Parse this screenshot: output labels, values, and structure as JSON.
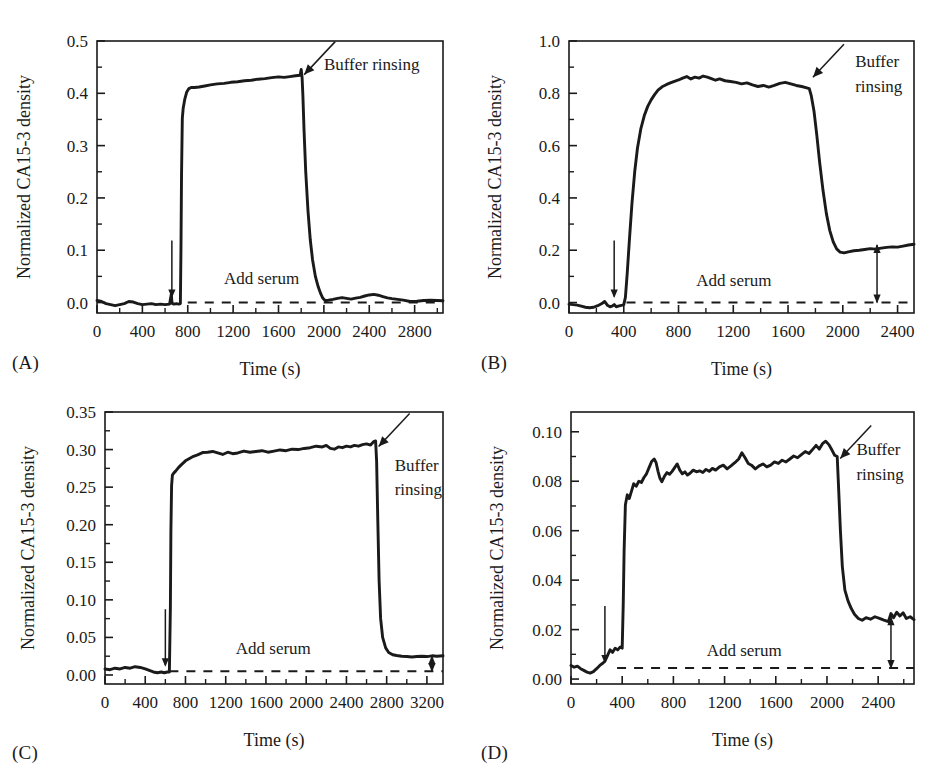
{
  "figure": {
    "panel_count": 4,
    "shared_ylabel": "Normalized CA15-3 density",
    "shared_xlabel": "Time (s)",
    "annotation_add_serum": "Add serum",
    "annotation_buffer_rinsing": "Buffer rinsing",
    "annotation_buffer": "Buffer",
    "annotation_rinsing": "rinsing",
    "line_color": "#1a1a1a",
    "axis_color": "#1a1a1a",
    "background": "#ffffff"
  },
  "chart_data": [
    {
      "type": "line",
      "panel": "(A)",
      "title": "",
      "xlabel": "Time (s)",
      "ylabel": "Normalized CA15-3 density",
      "xlim": [
        0,
        3050
      ],
      "ylim": [
        -0.02,
        0.5
      ],
      "xticks": [
        0,
        400,
        800,
        1200,
        1600,
        2000,
        2400,
        2800
      ],
      "yticks": [
        0.0,
        0.1,
        0.2,
        0.3,
        0.4,
        0.5
      ],
      "ytick_labels": [
        "0.0",
        "0.1",
        "0.2",
        "0.3",
        "0.4",
        "0.5"
      ],
      "xtick_labels": [
        "0",
        "400",
        "800",
        "1200",
        "1600",
        "2000",
        "2400",
        "2800"
      ],
      "minor_ticks": true,
      "grid": false,
      "legend": false,
      "baseline_dashed_y": 0.0,
      "baseline_dashed_x_start": 800,
      "baseline_dashed_x_end": 3050,
      "add_serum_time": 660,
      "buffer_rinsing_time": 1800,
      "plateau_value": 0.43,
      "final_value": 0.005,
      "annotations": [
        {
          "text": "Buffer rinsing",
          "x": 2000,
          "y": 0.445
        },
        {
          "text": "Add serum",
          "x": 1120,
          "y": 0.035
        }
      ],
      "x": [
        0,
        40,
        80,
        120,
        160,
        200,
        240,
        280,
        320,
        360,
        400,
        440,
        480,
        520,
        560,
        600,
        640,
        655,
        660,
        665,
        680,
        700,
        720,
        735,
        740,
        745,
        752,
        760,
        775,
        790,
        810,
        830,
        860,
        900,
        950,
        1000,
        1060,
        1120,
        1180,
        1240,
        1300,
        1360,
        1420,
        1480,
        1540,
        1600,
        1650,
        1700,
        1750,
        1790,
        1800,
        1808,
        1815,
        1825,
        1840,
        1860,
        1880,
        1900,
        1925,
        1950,
        1970,
        1990,
        2010,
        2040,
        2080,
        2120,
        2160,
        2200,
        2240,
        2280,
        2320,
        2360,
        2400,
        2440,
        2480,
        2520,
        2560,
        2600,
        2650,
        2700,
        2760,
        2820,
        2880,
        2940,
        3000,
        3050
      ],
      "y": [
        0.004,
        0.002,
        -0.002,
        -0.004,
        -0.006,
        -0.004,
        -0.002,
        0.002,
        0.001,
        -0.002,
        -0.004,
        -0.003,
        -0.002,
        -0.004,
        -0.003,
        -0.004,
        -0.003,
        0.016,
        0.002,
        -0.002,
        -0.003,
        -0.002,
        -0.003,
        -0.002,
        0.1,
        0.24,
        0.352,
        0.372,
        0.39,
        0.402,
        0.409,
        0.411,
        0.411,
        0.412,
        0.414,
        0.416,
        0.418,
        0.419,
        0.421,
        0.422,
        0.424,
        0.425,
        0.427,
        0.428,
        0.43,
        0.4315,
        0.4305,
        0.432,
        0.4335,
        0.4345,
        0.4455,
        0.43,
        0.395,
        0.33,
        0.25,
        0.175,
        0.12,
        0.082,
        0.05,
        0.03,
        0.018,
        0.0085,
        0.004,
        0.0045,
        0.006,
        0.008,
        0.0095,
        0.008,
        0.0065,
        0.0085,
        0.01,
        0.0125,
        0.0145,
        0.0155,
        0.014,
        0.0115,
        0.009,
        0.0075,
        0.006,
        0.0045,
        0.002,
        0.0025,
        0.004,
        0.0045,
        0.004,
        0.0035
      ]
    },
    {
      "type": "line",
      "panel": "(B)",
      "title": "",
      "xlabel": "Time (s)",
      "ylabel": "Normalized CA15-3 density",
      "xlim": [
        0,
        2520
      ],
      "ylim": [
        -0.04,
        1.0
      ],
      "xticks": [
        0,
        400,
        800,
        1200,
        1600,
        2000,
        2400
      ],
      "yticks": [
        0.0,
        0.2,
        0.4,
        0.6,
        0.8,
        1.0
      ],
      "ytick_labels": [
        "0.0",
        "0.2",
        "0.4",
        "0.6",
        "0.8",
        "1.0"
      ],
      "xtick_labels": [
        "0",
        "400",
        "800",
        "1200",
        "1600",
        "2000",
        "2400"
      ],
      "minor_ticks": true,
      "grid": false,
      "legend": false,
      "baseline_dashed_y": 0.0,
      "baseline_dashed_x_start": 420,
      "baseline_dashed_x_end": 2520,
      "add_serum_time": 330,
      "buffer_rinsing_time": 1760,
      "plateau_value": 0.85,
      "final_value": 0.22,
      "measure_arrow_x": 2250,
      "annotations": [
        {
          "text": "Buffer",
          "x": 2090,
          "y": 0.9
        },
        {
          "text": "rinsing",
          "x": 2090,
          "y": 0.805
        },
        {
          "text": "Add serum",
          "x": 930,
          "y": 0.065
        }
      ],
      "x": [
        0,
        30,
        60,
        90,
        120,
        150,
        180,
        210,
        240,
        260,
        280,
        300,
        315,
        330,
        345,
        360,
        375,
        390,
        400,
        412,
        425,
        440,
        460,
        480,
        500,
        525,
        550,
        575,
        600,
        625,
        650,
        680,
        710,
        740,
        770,
        800,
        830,
        860,
        890,
        920,
        950,
        980,
        1010,
        1040,
        1070,
        1100,
        1140,
        1180,
        1220,
        1260,
        1300,
        1340,
        1380,
        1420,
        1460,
        1500,
        1540,
        1580,
        1620,
        1660,
        1700,
        1730,
        1755,
        1770,
        1790,
        1810,
        1830,
        1855,
        1880,
        1905,
        1930,
        1955,
        1980,
        2010,
        2040,
        2080,
        2120,
        2160,
        2200,
        2240,
        2280,
        2320,
        2360,
        2400,
        2440,
        2480,
        2520
      ],
      "y": [
        -0.006,
        -0.008,
        -0.01,
        -0.014,
        -0.018,
        -0.02,
        -0.018,
        -0.012,
        -0.004,
        0.004,
        -0.01,
        -0.016,
        -0.014,
        -0.008,
        -0.016,
        -0.014,
        -0.012,
        -0.01,
        -0.008,
        0.02,
        0.11,
        0.23,
        0.38,
        0.5,
        0.59,
        0.665,
        0.715,
        0.75,
        0.775,
        0.795,
        0.812,
        0.825,
        0.833,
        0.84,
        0.846,
        0.851,
        0.858,
        0.864,
        0.855,
        0.862,
        0.858,
        0.866,
        0.862,
        0.856,
        0.85,
        0.855,
        0.848,
        0.845,
        0.842,
        0.836,
        0.84,
        0.832,
        0.826,
        0.83,
        0.824,
        0.83,
        0.838,
        0.842,
        0.836,
        0.83,
        0.826,
        0.822,
        0.818,
        0.79,
        0.73,
        0.64,
        0.54,
        0.43,
        0.34,
        0.275,
        0.232,
        0.205,
        0.193,
        0.19,
        0.194,
        0.198,
        0.2,
        0.203,
        0.206,
        0.204,
        0.208,
        0.211,
        0.213,
        0.212,
        0.216,
        0.22,
        0.223
      ]
    },
    {
      "type": "line",
      "panel": "(C)",
      "title": "",
      "xlabel": "Time (s)",
      "ylabel": "Normalized CA15-3 density",
      "xlim": [
        0,
        3360
      ],
      "ylim": [
        -0.012,
        0.35
      ],
      "xticks": [
        0,
        400,
        800,
        1200,
        1600,
        2000,
        2400,
        2800,
        3200
      ],
      "yticks": [
        0.0,
        0.05,
        0.1,
        0.15,
        0.2,
        0.25,
        0.3,
        0.35
      ],
      "ytick_labels": [
        "0.00",
        "0.05",
        "0.10",
        "0.15",
        "0.20",
        "0.25",
        "0.30",
        "0.35"
      ],
      "xtick_labels": [
        "0",
        "400",
        "800",
        "1200",
        "1600",
        "2000",
        "2400",
        "2800",
        "3200"
      ],
      "minor_ticks": true,
      "grid": false,
      "legend": false,
      "baseline_dashed_y": 0.005,
      "baseline_dashed_x_start": 640,
      "baseline_dashed_x_end": 3360,
      "add_serum_time": 600,
      "buffer_rinsing_time": 2690,
      "plateau_value": 0.3,
      "final_value": 0.025,
      "measure_arrow_x": 3250,
      "annotations": [
        {
          "text": "Buffer",
          "x": 2880,
          "y": 0.272
        },
        {
          "text": "rinsing",
          "x": 2880,
          "y": 0.24
        },
        {
          "text": "Add serum",
          "x": 1300,
          "y": 0.028
        }
      ],
      "x": [
        0,
        50,
        100,
        150,
        200,
        250,
        300,
        350,
        400,
        440,
        480,
        520,
        560,
        590,
        620,
        640,
        650,
        655,
        662,
        670,
        685,
        700,
        730,
        760,
        800,
        840,
        880,
        920,
        970,
        1020,
        1070,
        1120,
        1170,
        1220,
        1270,
        1320,
        1380,
        1440,
        1500,
        1560,
        1620,
        1680,
        1740,
        1800,
        1860,
        1920,
        1980,
        2040,
        2100,
        2160,
        2200,
        2240,
        2280,
        2320,
        2360,
        2400,
        2440,
        2480,
        2520,
        2560,
        2600,
        2640,
        2670,
        2690,
        2700,
        2712,
        2725,
        2740,
        2760,
        2790,
        2820,
        2860,
        2900,
        2950,
        3000,
        3050,
        3100,
        3150,
        3200,
        3250,
        3300,
        3360
      ],
      "y": [
        0.008,
        0.007,
        0.009,
        0.008,
        0.01,
        0.009,
        0.011,
        0.01,
        0.008,
        0.006,
        0.004,
        0.003,
        0.004,
        0.003,
        0.004,
        0.004,
        0.09,
        0.19,
        0.252,
        0.266,
        0.269,
        0.271,
        0.276,
        0.28,
        0.285,
        0.288,
        0.291,
        0.293,
        0.296,
        0.2965,
        0.2975,
        0.2955,
        0.2935,
        0.2965,
        0.2945,
        0.2955,
        0.298,
        0.2965,
        0.2975,
        0.2985,
        0.2965,
        0.298,
        0.2995,
        0.2985,
        0.3005,
        0.3,
        0.3015,
        0.3025,
        0.3045,
        0.3035,
        0.3055,
        0.3015,
        0.3005,
        0.3035,
        0.3025,
        0.3045,
        0.3035,
        0.3055,
        0.3045,
        0.3065,
        0.3075,
        0.306,
        0.3105,
        0.3115,
        0.285,
        0.205,
        0.125,
        0.075,
        0.05,
        0.036,
        0.03,
        0.027,
        0.026,
        0.025,
        0.0245,
        0.024,
        0.0245,
        0.025,
        0.0245,
        0.0255,
        0.025,
        0.0255
      ]
    },
    {
      "type": "line",
      "panel": "(D)",
      "title": "",
      "xlabel": "Time (s)",
      "ylabel": "Normalized CA15-3 density",
      "xlim": [
        0,
        2680
      ],
      "ylim": [
        -0.002,
        0.108
      ],
      "xticks": [
        0,
        400,
        800,
        1200,
        1600,
        2000,
        2400,
        2800
      ],
      "yticks": [
        0.0,
        0.02,
        0.04,
        0.06,
        0.08,
        0.1
      ],
      "ytick_labels": [
        "0.00",
        "0.02",
        "0.04",
        "0.06",
        "0.08",
        "0.10"
      ],
      "xtick_labels": [
        "0",
        "400",
        "800",
        "1200",
        "1600",
        "2000",
        "2400",
        "2800"
      ],
      "minor_ticks": true,
      "grid": false,
      "legend": false,
      "baseline_dashed_y": 0.0045,
      "baseline_dashed_x_start": 360,
      "baseline_dashed_x_end": 2680,
      "add_serum_time": 265,
      "buffer_rinsing_time": 2080,
      "plateau_value": 0.088,
      "final_value": 0.025,
      "measure_arrow_x": 2500,
      "annotations": [
        {
          "text": "Buffer",
          "x": 2230,
          "y": 0.0905
        },
        {
          "text": "rinsing",
          "x": 2230,
          "y": 0.0805
        },
        {
          "text": "Add serum",
          "x": 1060,
          "y": 0.0095
        }
      ],
      "x": [
        0,
        25,
        50,
        75,
        100,
        125,
        150,
        175,
        200,
        225,
        250,
        265,
        285,
        305,
        325,
        345,
        365,
        385,
        400,
        408,
        415,
        425,
        440,
        455,
        470,
        490,
        510,
        530,
        550,
        570,
        590,
        610,
        630,
        650,
        665,
        680,
        695,
        710,
        730,
        750,
        770,
        790,
        810,
        830,
        850,
        870,
        890,
        910,
        930,
        955,
        980,
        1005,
        1030,
        1055,
        1080,
        1105,
        1130,
        1160,
        1190,
        1220,
        1250,
        1280,
        1310,
        1335,
        1360,
        1385,
        1410,
        1440,
        1470,
        1500,
        1530,
        1560,
        1590,
        1620,
        1650,
        1680,
        1710,
        1740,
        1770,
        1800,
        1830,
        1860,
        1890,
        1915,
        1940,
        1965,
        1990,
        2015,
        2040,
        2060,
        2080,
        2092,
        2105,
        2120,
        2140,
        2165,
        2190,
        2215,
        2245,
        2275,
        2305,
        2340,
        2375,
        2410,
        2445,
        2480,
        2500,
        2520,
        2545,
        2570,
        2595,
        2620,
        2650,
        2680
      ],
      "y": [
        0.0055,
        0.0048,
        0.0052,
        0.0042,
        0.0035,
        0.0028,
        0.0024,
        0.003,
        0.0042,
        0.0055,
        0.0065,
        0.0072,
        0.0095,
        0.0118,
        0.0108,
        0.0125,
        0.0118,
        0.013,
        0.0125,
        0.03,
        0.052,
        0.0705,
        0.0745,
        0.073,
        0.0755,
        0.079,
        0.078,
        0.08,
        0.0795,
        0.0815,
        0.083,
        0.0855,
        0.088,
        0.089,
        0.0875,
        0.084,
        0.0812,
        0.0798,
        0.082,
        0.0835,
        0.0828,
        0.084,
        0.0855,
        0.087,
        0.0845,
        0.083,
        0.0838,
        0.0825,
        0.0832,
        0.0845,
        0.0838,
        0.0842,
        0.0835,
        0.0848,
        0.084,
        0.0852,
        0.0845,
        0.0858,
        0.0865,
        0.085,
        0.0862,
        0.0875,
        0.089,
        0.0915,
        0.0895,
        0.0872,
        0.0865,
        0.085,
        0.0862,
        0.087,
        0.0858,
        0.0865,
        0.0878,
        0.0872,
        0.0885,
        0.0878,
        0.089,
        0.0902,
        0.0895,
        0.0908,
        0.092,
        0.0912,
        0.093,
        0.0945,
        0.093,
        0.0952,
        0.0962,
        0.0948,
        0.0925,
        0.0905,
        0.09,
        0.076,
        0.06,
        0.0455,
        0.036,
        0.0315,
        0.0285,
        0.0262,
        0.0245,
        0.0238,
        0.0248,
        0.0242,
        0.0252,
        0.0245,
        0.0238,
        0.0232,
        0.0265,
        0.0248,
        0.027,
        0.0255,
        0.0268,
        0.0245,
        0.0252,
        0.024
      ]
    }
  ]
}
